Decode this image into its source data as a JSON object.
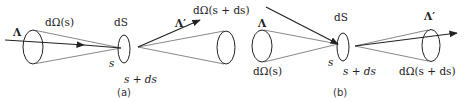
{
  "panels": {
    "a": {
      "caption": "(a)",
      "incoming_beam_label": "Λ",
      "incoming_solid_angle_label": "dΩ(s)",
      "surface_label": "dS",
      "point_s_label": "s",
      "point_s_ds_label": "s + ds",
      "outgoing_beam_label": "Λ′",
      "outgoing_solid_angle_label": "dΩ(s + ds)"
    },
    "b": {
      "caption": "(b)",
      "incoming_beam_label": "Λ",
      "incoming_solid_angle_label": "dΩ(s)",
      "surface_label": "dS",
      "point_s_label": "s",
      "point_s_ds_label": "s + ds",
      "outgoing_beam_label": "Λ′",
      "outgoing_solid_angle_label": "dΩ(s + ds)"
    }
  },
  "colors": {
    "stroke": "#222222",
    "cone_line": "#555555",
    "background": "#ffffff"
  }
}
